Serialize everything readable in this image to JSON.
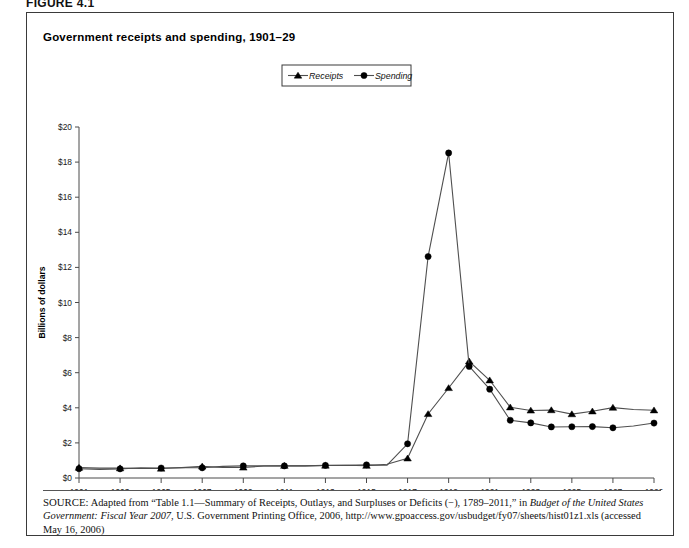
{
  "figure": {
    "label": "FIGURE 4.1",
    "title": "Government receipts and spending, 1901–29"
  },
  "legend": {
    "position": "top-center",
    "entries": [
      {
        "label": "Receipts",
        "marker": "triangle"
      },
      {
        "label": "Spending",
        "marker": "circle"
      }
    ]
  },
  "source": {
    "label": "SOURCE:",
    "text_1": " Adapted from “Table 1.1—Summary of Receipts, Outlays, and Surpluses or Deficits (−), 1789–2011,” in ",
    "italic_1": "Budget of the United States Government: Fiscal Year 2007",
    "text_2": ", U.S. Government Printing Office, 2006, http://www.gpoaccess.gov/usbudget/fy07/sheets/hist01z1.xls (accessed May 16, 2006)"
  },
  "chart_data": {
    "type": "line",
    "title": "Government receipts and spending, 1901–29",
    "xlabel": "",
    "ylabel": "Billions of dollars",
    "xlim": [
      1901,
      1929
    ],
    "ylim": [
      0,
      20
    ],
    "ytick_step": 2,
    "grid": false,
    "legend_position": "top-center",
    "x": [
      1901,
      1902,
      1903,
      1904,
      1905,
      1906,
      1907,
      1908,
      1909,
      1910,
      1911,
      1912,
      1913,
      1914,
      1915,
      1916,
      1917,
      1918,
      1919,
      1920,
      1921,
      1922,
      1923,
      1924,
      1925,
      1926,
      1927,
      1928,
      1929
    ],
    "xtick_labels": [
      "1901",
      "1903",
      "1905",
      "1907",
      "1909",
      "1911",
      "1913",
      "1915",
      "1917",
      "1919",
      "1921",
      "1923",
      "1925",
      "1927",
      "1929"
    ],
    "ytick_labels": [
      "$0",
      "$2",
      "$4",
      "$6",
      "$8",
      "$10",
      "$12",
      "$14",
      "$16",
      "$18",
      "$20"
    ],
    "series": [
      {
        "name": "Receipts",
        "marker": "triangle",
        "values": [
          0.59,
          0.56,
          0.56,
          0.54,
          0.54,
          0.59,
          0.66,
          0.6,
          0.6,
          0.68,
          0.7,
          0.69,
          0.71,
          0.73,
          0.7,
          0.78,
          1.12,
          3.65,
          5.13,
          6.65,
          5.57,
          4.03,
          3.85,
          3.87,
          3.64,
          3.8,
          4.01,
          3.9,
          3.86
        ],
        "marked_points": [
          1901,
          1903,
          1905,
          1907,
          1909,
          1911,
          1913,
          1915,
          1917,
          1918,
          1919,
          1920,
          1921,
          1922,
          1923,
          1924,
          1925,
          1926,
          1927,
          1929
        ]
      },
      {
        "name": "Spending",
        "marker": "circle",
        "values": [
          0.53,
          0.49,
          0.52,
          0.58,
          0.57,
          0.58,
          0.58,
          0.66,
          0.69,
          0.69,
          0.69,
          0.69,
          0.72,
          0.73,
          0.75,
          0.73,
          1.95,
          12.62,
          18.52,
          6.36,
          5.06,
          3.29,
          3.14,
          2.91,
          2.92,
          2.93,
          2.86,
          2.96,
          3.13
        ],
        "marked_points": [
          1901,
          1903,
          1905,
          1907,
          1909,
          1911,
          1913,
          1915,
          1917,
          1918,
          1919,
          1920,
          1921,
          1922,
          1923,
          1924,
          1925,
          1926,
          1927,
          1929
        ]
      }
    ]
  }
}
